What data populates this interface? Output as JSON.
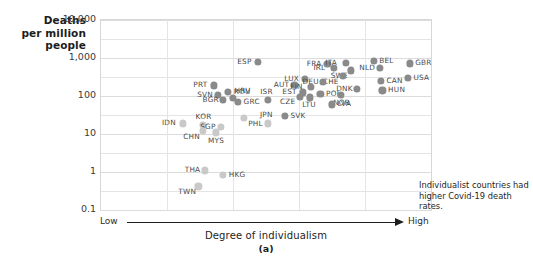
{
  "figure": {
    "y_axis_title_lines": [
      "Deaths",
      "per million",
      "people"
    ],
    "x_axis_label": "Degree of individualism",
    "x_low_label": "Low",
    "x_high_label": "High",
    "caption": "(a)",
    "annotation": "Individualist countries had higher Covid-19 death rates.",
    "dot_color_dark": "#8a8a8a",
    "dot_color_light": "#c9c9c9",
    "grid_color": "#e4e4e4",
    "frame_color": "#d7d7d7"
  },
  "chart_data": {
    "type": "scatter",
    "title": "",
    "xlabel": "Degree of individualism",
    "ylabel": "Deaths per million people",
    "yscale": "log",
    "ylim": [
      0.1,
      10000
    ],
    "ytick_labels": [
      "10,000",
      "1,000",
      "100",
      "10",
      "1",
      "0.1"
    ],
    "ytick_values": [
      10000,
      1000,
      100,
      10,
      1,
      0.1
    ],
    "xlim_labels": [
      "Low",
      "High"
    ],
    "xticks_shown": false,
    "grid": true,
    "legend": null,
    "annotations": [
      {
        "text": "Individualist countries had higher Covid-19 death rates.",
        "x_frac": 0.66,
        "y_frac": 0.73
      }
    ],
    "point_label_field": "code",
    "points": [
      {
        "code": "ESP",
        "x_frac": 0.475,
        "y_value": 800,
        "shade": "dark"
      },
      {
        "code": "FRA",
        "x_frac": 0.686,
        "y_value": 700,
        "shade": "dark"
      },
      {
        "code": "ITA",
        "x_frac": 0.742,
        "y_value": 760,
        "shade": "dark"
      },
      {
        "code": "BEL",
        "x_frac": 0.826,
        "y_value": 840,
        "shade": "dark"
      },
      {
        "code": "GBR",
        "x_frac": 0.935,
        "y_value": 720,
        "shade": "dark"
      },
      {
        "code": "NLD",
        "x_frac": 0.845,
        "y_value": 560,
        "shade": "dark"
      },
      {
        "code": "IRL",
        "x_frac": 0.706,
        "y_value": 540,
        "shade": "dark"
      },
      {
        "code": "SWE",
        "x_frac": 0.757,
        "y_value": 470,
        "shade": "dark"
      },
      {
        "code": "CHE",
        "x_frac": 0.733,
        "y_value": 330,
        "shade": "dark"
      },
      {
        "code": "USA",
        "x_frac": 0.93,
        "y_value": 300,
        "shade": "dark"
      },
      {
        "code": "CAN",
        "x_frac": 0.848,
        "y_value": 250,
        "shade": "dark"
      },
      {
        "code": "LUX",
        "x_frac": 0.618,
        "y_value": 280,
        "shade": "dark"
      },
      {
        "code": "DEU",
        "x_frac": 0.673,
        "y_value": 230,
        "shade": "dark"
      },
      {
        "code": "AUT",
        "x_frac": 0.586,
        "y_value": 200,
        "shade": "dark"
      },
      {
        "code": "FIN",
        "x_frac": 0.636,
        "y_value": 175,
        "shade": "dark"
      },
      {
        "code": "DNK",
        "x_frac": 0.775,
        "y_value": 150,
        "shade": "dark"
      },
      {
        "code": "HUN",
        "x_frac": 0.853,
        "y_value": 140,
        "shade": "dark"
      },
      {
        "code": "EST",
        "x_frac": 0.612,
        "y_value": 125,
        "shade": "dark"
      },
      {
        "code": "POL",
        "x_frac": 0.665,
        "y_value": 115,
        "shade": "dark"
      },
      {
        "code": "NOR",
        "x_frac": 0.727,
        "y_value": 108,
        "shade": "dark"
      },
      {
        "code": "CZE",
        "x_frac": 0.603,
        "y_value": 95,
        "shade": "dark"
      },
      {
        "code": "LTU",
        "x_frac": 0.633,
        "y_value": 92,
        "shade": "dark"
      },
      {
        "code": "LVA",
        "x_frac": 0.7,
        "y_value": 60,
        "shade": "dark"
      },
      {
        "code": "PRT",
        "x_frac": 0.342,
        "y_value": 190,
        "shade": "dark"
      },
      {
        "code": "ROU",
        "x_frac": 0.385,
        "y_value": 130,
        "shade": "dark"
      },
      {
        "code": "SVN",
        "x_frac": 0.354,
        "y_value": 105,
        "shade": "dark"
      },
      {
        "code": "HRV",
        "x_frac": 0.4,
        "y_value": 88,
        "shade": "dark"
      },
      {
        "code": "BGR",
        "x_frac": 0.37,
        "y_value": 78,
        "shade": "dark"
      },
      {
        "code": "GRC",
        "x_frac": 0.415,
        "y_value": 70,
        "shade": "dark"
      },
      {
        "code": "ISR",
        "x_frac": 0.506,
        "y_value": 80,
        "shade": "dark"
      },
      {
        "code": "SVK",
        "x_frac": 0.557,
        "y_value": 30,
        "shade": "dark"
      },
      {
        "code": "PHL",
        "x_frac": 0.432,
        "y_value": 27,
        "shade": "light"
      },
      {
        "code": "KOR",
        "x_frac": 0.31,
        "y_value": 17,
        "shade": "light"
      },
      {
        "code": "IDN",
        "x_frac": 0.247,
        "y_value": 19,
        "shade": "light"
      },
      {
        "code": "SGP",
        "x_frac": 0.363,
        "y_value": 15,
        "shade": "light"
      },
      {
        "code": "CHN",
        "x_frac": 0.31,
        "y_value": 12,
        "shade": "light"
      },
      {
        "code": "MYS",
        "x_frac": 0.348,
        "y_value": 11,
        "shade": "light"
      },
      {
        "code": "JPN",
        "x_frac": 0.505,
        "y_value": 19,
        "shade": "light"
      },
      {
        "code": "THA",
        "x_frac": 0.316,
        "y_value": 1.1,
        "shade": "light"
      },
      {
        "code": "HKG",
        "x_frac": 0.37,
        "y_value": 0.85,
        "shade": "light"
      },
      {
        "code": "TWN",
        "x_frac": 0.295,
        "y_value": 0.42,
        "shade": "light"
      }
    ],
    "label_offsets": {
      "ESP": "left",
      "FRA": "left",
      "ITA": "left",
      "BEL": "right",
      "GBR": "right",
      "NLD": "left",
      "IRL": "left",
      "SWE": "below-left",
      "CHE": "below-left",
      "USA": "right",
      "CAN": "right",
      "LUX": "left",
      "DEU": "left",
      "AUT": "left",
      "FIN": "left",
      "DNK": "left",
      "HUN": "right",
      "EST": "left",
      "POL": "right",
      "NOR": "below",
      "CZE": "below-left",
      "LTU": "below",
      "LVA": "right",
      "PRT": "left",
      "ROU": "right",
      "SVN": "left",
      "HRV": "above-right",
      "BGR": "left",
      "GRC": "right",
      "ISR": "above",
      "SVK": "right",
      "PHL": "below-right",
      "KOR": "above",
      "IDN": "left",
      "SGP": "left",
      "CHN": "below-left",
      "MYS": "below",
      "JPN": "above",
      "THA": "left",
      "HKG": "right",
      "TWN": "below-left"
    }
  }
}
